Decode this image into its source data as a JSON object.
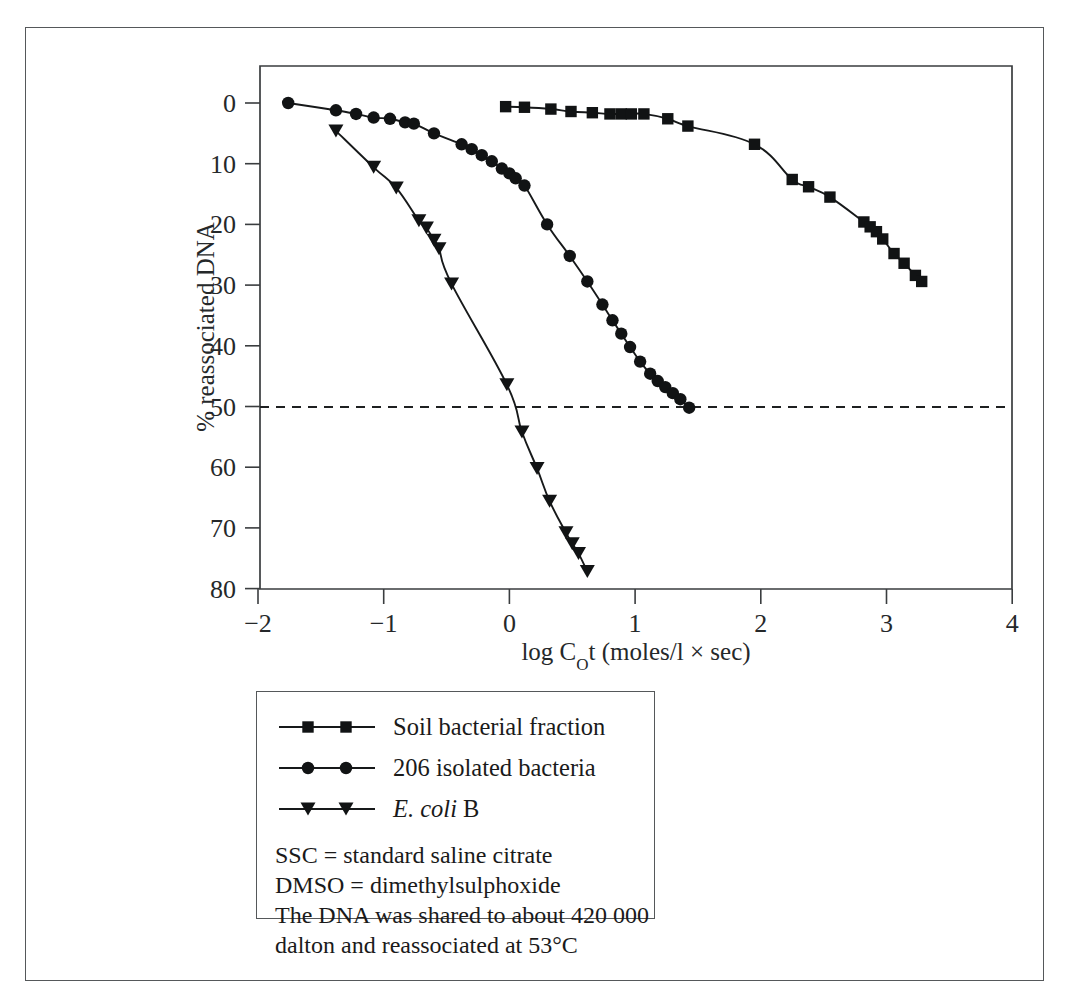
{
  "figure": {
    "y_axis_title": "% reassociated DNA",
    "x_axis_title_prefix": "log C",
    "x_axis_title_sub": "O",
    "x_axis_title_suffix": "t (moles/l × sec)",
    "x_tick_labels": [
      "−2",
      "−1",
      "0",
      "1",
      "2",
      "3",
      "4"
    ],
    "y_tick_labels": [
      "0",
      "10",
      "20",
      "30",
      "40",
      "50",
      "60",
      "70",
      "80"
    ],
    "half_reassociation_value": "50"
  },
  "legend": {
    "entries": [
      {
        "label": "Soil bacterial fraction",
        "marker": "square",
        "italic_part": "",
        "plain_part": "Soil bacterial fraction"
      },
      {
        "label": "206 isolated bacteria",
        "marker": "circle",
        "italic_part": "",
        "plain_part": "206 isolated bacteria"
      },
      {
        "label": "E. coli B",
        "marker": "triangle-down",
        "italic_part": "E. coli",
        "plain_part": " B"
      }
    ],
    "notes": [
      "SSC = standard saline citrate",
      "DMSO = dimethylsulphoxide",
      "The DNA was shared to about 420 000",
      "dalton and reassociated at 53°C"
    ]
  },
  "colors": {
    "ink": "#17191a",
    "frame": "#55585a",
    "axis": "#3a3d3f",
    "background": "#ffffff"
  },
  "chart_data": {
    "type": "scatter",
    "title": "",
    "xlabel": "log C0t (moles/l × sec)",
    "ylabel": "% reassociated DNA",
    "xlim": [
      -2,
      4
    ],
    "ylim": [
      0,
      80
    ],
    "y_inverted": true,
    "grid": false,
    "legend_position": "below-plot",
    "annotations": [
      {
        "type": "hline",
        "y": 50,
        "style": "dashed",
        "label": "50% reassociation"
      }
    ],
    "series": [
      {
        "name": "Soil bacterial fraction",
        "marker": "square",
        "points": [
          [
            -0.03,
            0.6
          ],
          [
            0.12,
            0.7
          ],
          [
            0.33,
            1.0
          ],
          [
            0.49,
            1.4
          ],
          [
            0.66,
            1.6
          ],
          [
            0.8,
            1.8
          ],
          [
            0.89,
            1.8
          ],
          [
            0.97,
            1.8
          ],
          [
            1.07,
            1.8
          ],
          [
            1.26,
            2.6
          ],
          [
            1.42,
            3.8
          ],
          [
            1.95,
            6.8
          ],
          [
            2.25,
            12.6
          ],
          [
            2.38,
            13.8
          ],
          [
            2.55,
            15.5
          ],
          [
            2.82,
            19.6
          ],
          [
            2.87,
            20.4
          ],
          [
            2.92,
            21.2
          ],
          [
            2.97,
            22.4
          ],
          [
            3.06,
            24.8
          ],
          [
            3.14,
            26.4
          ],
          [
            3.23,
            28.4
          ],
          [
            3.28,
            29.4
          ]
        ]
      },
      {
        "name": "206 isolated bacteria",
        "marker": "circle",
        "points": [
          [
            -1.76,
            0.0
          ],
          [
            -1.38,
            1.2
          ],
          [
            -1.22,
            1.8
          ],
          [
            -1.08,
            2.4
          ],
          [
            -0.95,
            2.6
          ],
          [
            -0.83,
            3.2
          ],
          [
            -0.76,
            3.4
          ],
          [
            -0.6,
            5.0
          ],
          [
            -0.38,
            6.8
          ],
          [
            -0.3,
            7.6
          ],
          [
            -0.22,
            8.6
          ],
          [
            -0.14,
            9.6
          ],
          [
            -0.06,
            10.8
          ],
          [
            0.0,
            11.6
          ],
          [
            0.05,
            12.4
          ],
          [
            0.12,
            13.6
          ],
          [
            0.3,
            20.0
          ],
          [
            0.48,
            25.2
          ],
          [
            0.62,
            29.4
          ],
          [
            0.74,
            33.2
          ],
          [
            0.82,
            35.8
          ],
          [
            0.89,
            38.0
          ],
          [
            0.96,
            40.2
          ],
          [
            1.04,
            42.6
          ],
          [
            1.12,
            44.6
          ],
          [
            1.18,
            45.8
          ],
          [
            1.24,
            46.8
          ],
          [
            1.3,
            47.8
          ],
          [
            1.36,
            48.8
          ],
          [
            1.43,
            50.2
          ]
        ]
      },
      {
        "name": "E. coli B",
        "marker": "triangle-down",
        "points": [
          [
            -1.38,
            4.6
          ],
          [
            -1.08,
            10.6
          ],
          [
            -0.9,
            14.0
          ],
          [
            -0.72,
            19.4
          ],
          [
            -0.66,
            20.6
          ],
          [
            -0.6,
            22.6
          ],
          [
            -0.56,
            24.0
          ],
          [
            -0.46,
            29.8
          ],
          [
            -0.02,
            46.4
          ],
          [
            0.1,
            54.2
          ],
          [
            0.22,
            60.2
          ],
          [
            0.32,
            65.6
          ],
          [
            0.45,
            70.8
          ],
          [
            0.5,
            72.6
          ],
          [
            0.55,
            74.2
          ],
          [
            0.62,
            77.2
          ]
        ]
      }
    ]
  }
}
